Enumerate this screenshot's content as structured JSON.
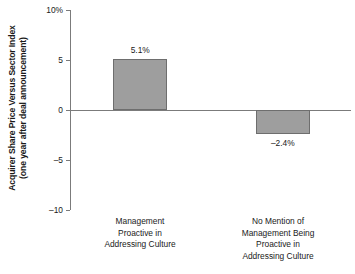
{
  "chart_data": {
    "type": "bar",
    "title": "",
    "xlabel": "",
    "ylabel": "Acquirer Share Price Versus Sector Index (one year after deal announcement)",
    "ylabel_lines": [
      "Acquirer Share Price Versus Sector Index",
      "(one year after deal announcement)"
    ],
    "categories": [
      "Management Proactive in Addressing Culture",
      "No Mention of Management Being Proactive in Addressing Culture"
    ],
    "category_lines": [
      [
        "Management",
        "Proactive in",
        "Addressing Culture"
      ],
      [
        "No Mention of",
        "Management Being",
        "Proactive in",
        "Addressing Culture"
      ]
    ],
    "values": [
      5.1,
      -2.4
    ],
    "value_labels": [
      "5.1%",
      "–2.4%"
    ],
    "ylim": [
      -10,
      10
    ],
    "yticks": [
      10,
      5,
      0,
      -5,
      -10
    ],
    "ytick_labels": [
      "10%",
      "5",
      "0",
      "–5",
      "–10"
    ],
    "grid": false,
    "legend": "none",
    "bar_color": "#9e9e9e",
    "bar_border_color": "#6e6e6e",
    "axis_color": "#7b7b7b",
    "text_color": "#1a1a1a"
  }
}
